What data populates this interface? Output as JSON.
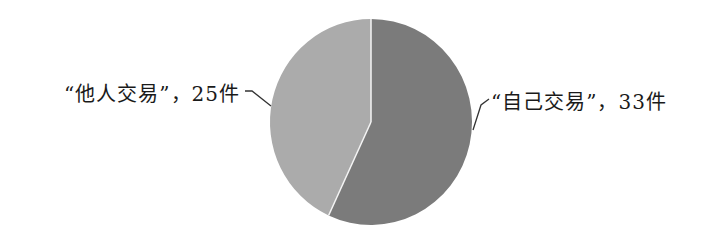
{
  "chart_data": {
    "type": "pie",
    "title": "",
    "categories": [
      "“自己交易”",
      "“他人交易”"
    ],
    "values": [
      33,
      25
    ],
    "unit": "件",
    "labels": [
      "“自己交易”，33件",
      "“他人交易”，25件"
    ],
    "colors": [
      "#7b7b7b",
      "#ababab"
    ],
    "start_angle_deg": 90,
    "direction": "clockwise",
    "legend": "none (data labels with leader lines)"
  },
  "labels": {
    "left": "“他人交易”，25件",
    "right": "“自己交易”，33件"
  },
  "colors": {
    "self_trade": "#7b7b7b",
    "other_trade": "#ababab",
    "separator": "#f4f4f4",
    "leader_line": "#333333"
  }
}
